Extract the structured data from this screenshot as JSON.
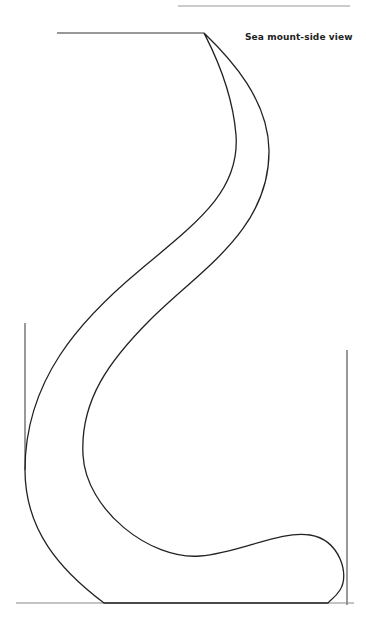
{
  "diagram": {
    "title": "Sea mount-side view",
    "stroke_color": "#222222",
    "rule_color": "#888888",
    "background": "#ffffff"
  }
}
